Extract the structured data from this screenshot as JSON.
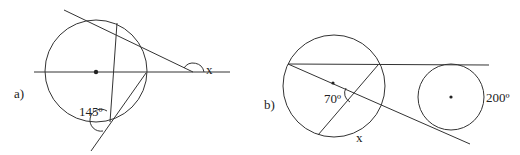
{
  "figures": [
    {
      "id": "a",
      "label": "a)",
      "angle_label": "145º",
      "unknown_label": "x",
      "description": "Circle with a diameter line extended, a secant meeting it outside at angle x, and two chords meeting below forming 145º"
    },
    {
      "id": "b",
      "label": "b)",
      "angle_label": "70º",
      "unknown_label": "x",
      "arc_label": "200º",
      "description": "Two circles with common tangent lines; intersecting chords in left circle form 70º, arc x; right circle arc 200º"
    }
  ],
  "colors": {
    "line": "#333333",
    "text": "#222222",
    "background": "#ffffff"
  }
}
